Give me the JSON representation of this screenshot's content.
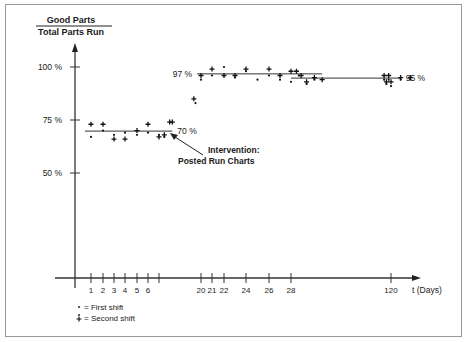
{
  "chart_data": {
    "type": "scatter",
    "title": "",
    "ylabel_numerator": "Good Parts",
    "ylabel_denominator": "Total Parts Run",
    "xlabel": "t (Days)",
    "ylim": [
      0,
      105
    ],
    "y_ticks": [
      {
        "value": 100,
        "label": "100 %"
      },
      {
        "value": 75,
        "label": "75 %"
      },
      {
        "value": 50,
        "label": "50 %"
      }
    ],
    "x_ticks": [
      {
        "value": 1,
        "label": "1"
      },
      {
        "value": 2,
        "label": "2"
      },
      {
        "value": 3,
        "label": "3"
      },
      {
        "value": 4,
        "label": "4"
      },
      {
        "value": 5,
        "label": "5"
      },
      {
        "value": 6,
        "label": "6"
      },
      {
        "value": 7,
        "label": ""
      },
      {
        "value": 20,
        "label": "20"
      },
      {
        "value": 21,
        "label": "21"
      },
      {
        "value": 22,
        "label": "22"
      },
      {
        "value": 24,
        "label": "24"
      },
      {
        "value": 26,
        "label": "26"
      },
      {
        "value": 28,
        "label": "28"
      },
      {
        "value": 120,
        "label": "120"
      }
    ],
    "grid": false,
    "legend": {
      "position": "bottom-left",
      "entries": [
        {
          "marker": "dot",
          "label": "= First shift"
        },
        {
          "marker": "plus",
          "label": "= Second shift"
        }
      ]
    },
    "reference_lines": [
      {
        "label": "70 %",
        "value": 70,
        "x_start": 0.5,
        "x_end": 9.5,
        "label_side": "right"
      },
      {
        "label": "97 %",
        "value": 97,
        "x_start": 19.3,
        "x_end": 32,
        "label_side": "left"
      },
      {
        "label": "95 %",
        "value": 95,
        "x_start": 28,
        "x_end": 122,
        "label_side": "right"
      }
    ],
    "annotations": [
      {
        "text_line1": "Intervention:",
        "text_line2": "Posted Run Charts",
        "points_to_day": 9.2,
        "points_to_value": 68
      }
    ],
    "series": [
      {
        "name": "First shift",
        "marker": "dot",
        "points": [
          [
            1,
            67
          ],
          [
            2,
            70
          ],
          [
            3,
            68
          ],
          [
            4,
            69
          ],
          [
            5,
            68
          ],
          [
            6,
            69
          ],
          [
            7,
            68
          ],
          [
            8,
            67
          ],
          [
            19,
            83
          ],
          [
            20,
            94
          ],
          [
            21,
            96
          ],
          [
            22,
            100
          ],
          [
            23,
            95
          ],
          [
            24,
            98
          ],
          [
            25,
            94
          ],
          [
            26,
            96
          ],
          [
            27,
            94
          ],
          [
            28,
            93
          ],
          [
            29,
            96
          ],
          [
            30,
            92
          ],
          [
            31,
            94
          ],
          [
            114,
            94
          ],
          [
            116,
            92
          ],
          [
            118,
            94
          ],
          [
            120,
            91
          ],
          [
            122,
            94
          ],
          [
            124,
            94
          ]
        ]
      },
      {
        "name": "Second shift",
        "marker": "plus",
        "points": [
          [
            1,
            73
          ],
          [
            2,
            73
          ],
          [
            3,
            66
          ],
          [
            4,
            66
          ],
          [
            5,
            70
          ],
          [
            6,
            73
          ],
          [
            7,
            67
          ],
          [
            8,
            68
          ],
          [
            9,
            74
          ],
          [
            9.5,
            74
          ],
          [
            18.7,
            85
          ],
          [
            20,
            96
          ],
          [
            21,
            99
          ],
          [
            22,
            96
          ],
          [
            23,
            96
          ],
          [
            24,
            99
          ],
          [
            26,
            99
          ],
          [
            27,
            96
          ],
          [
            28,
            98
          ],
          [
            28.7,
            98
          ],
          [
            29.3,
            96
          ],
          [
            30,
            93
          ],
          [
            31,
            95
          ],
          [
            32,
            94
          ],
          [
            114,
            96
          ],
          [
            116,
            93
          ],
          [
            118,
            96
          ],
          [
            120,
            93
          ],
          [
            122,
            95
          ],
          [
            124,
            95
          ]
        ]
      }
    ]
  }
}
